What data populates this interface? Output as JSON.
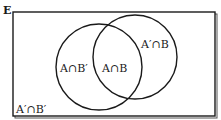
{
  "diagram": {
    "type": "venn",
    "universal_set_label": "E",
    "sets": [
      "A",
      "B"
    ],
    "regions": {
      "a_only": "A∩B′",
      "intersection": "A∩B",
      "b_only": "A′∩B",
      "neither": "A′∩B′"
    },
    "colors": {
      "stroke": "#1a1a1a",
      "background": "#ffffff",
      "shadow": "#555555"
    }
  }
}
